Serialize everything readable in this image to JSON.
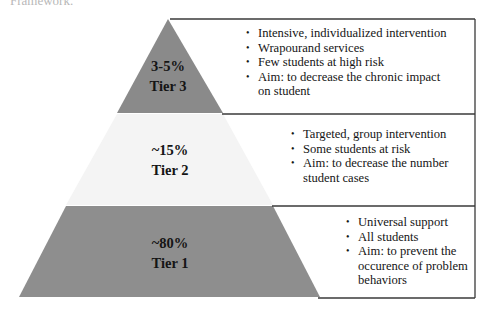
{
  "caption_fragment": "Framework.",
  "colors": {
    "tier3_fill": "#8a8a8a",
    "tier2_fill": "#f4f4f4",
    "tier1_fill": "#8e8e8e",
    "border": "#3a3a3a"
  },
  "tiers": [
    {
      "id": "tier3",
      "percent": "3-5%",
      "name": "Tier 3",
      "bullets": [
        "Intensive, individualized intervention",
        "Wrapourand services",
        "Few students at high risk",
        "Aim: to decrease the chronic impact on student"
      ]
    },
    {
      "id": "tier2",
      "percent": "~15%",
      "name": "Tier 2",
      "bullets": [
        "Targeted, group intervention",
        "Some students at risk",
        "Aim: to decrease the number student cases"
      ]
    },
    {
      "id": "tier1",
      "percent": "~80%",
      "name": "Tier 1",
      "bullets": [
        "Universal support",
        "All students",
        "Aim: to prevent the occurence of problem behaviors"
      ]
    }
  ]
}
